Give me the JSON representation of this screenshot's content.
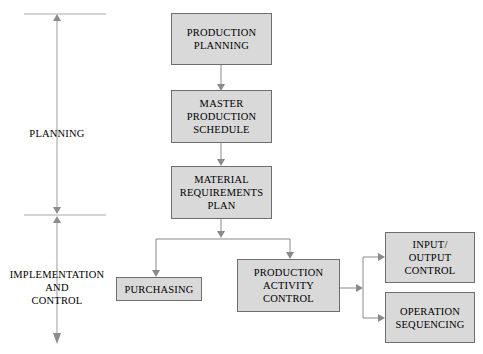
{
  "diagram": {
    "fill_color": "#d9d9d9",
    "stroke_color": "#6e6e6e",
    "text_color": "#000000",
    "background_color": "#ffffff"
  },
  "phases": [
    {
      "id": "planning",
      "label": "PLANNING"
    },
    {
      "id": "implementation-and-control",
      "label": "IMPLEMENTATION\nAND\nCONTROL"
    }
  ],
  "nodes": [
    {
      "id": "production-planning",
      "label": "PRODUCTION\nPLANNING"
    },
    {
      "id": "master-production-schedule",
      "label": "MASTER\nPRODUCTION\nSCHEDULE"
    },
    {
      "id": "material-requirements-plan",
      "label": "MATERIAL\nREQUIREMENTS\nPLAN"
    },
    {
      "id": "purchasing",
      "label": "PURCHASING"
    },
    {
      "id": "production-activity-control",
      "label": "PRODUCTION\nACTIVITY\nCONTROL"
    },
    {
      "id": "input-output-control",
      "label": "INPUT/\nOUTPUT\nCONTROL"
    },
    {
      "id": "operation-sequencing",
      "label": "OPERATION\nSEQUENCING"
    }
  ],
  "connections": [
    {
      "from": "production-planning",
      "to": "master-production-schedule"
    },
    {
      "from": "master-production-schedule",
      "to": "material-requirements-plan"
    },
    {
      "from": "material-requirements-plan",
      "to": "purchasing"
    },
    {
      "from": "material-requirements-plan",
      "to": "production-activity-control"
    },
    {
      "from": "production-activity-control",
      "to": "input-output-control"
    },
    {
      "from": "production-activity-control",
      "to": "operation-sequencing"
    }
  ]
}
